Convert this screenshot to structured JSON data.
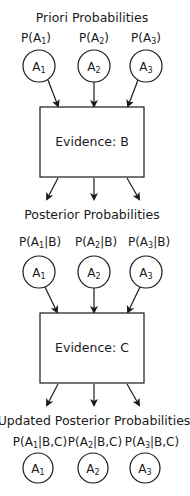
{
  "sections": {
    "priori": {
      "title": "Priori Probabilities",
      "labels": [
        {
          "pre": "P(A",
          "sub": "1",
          "post": ")"
        },
        {
          "pre": "P(A",
          "sub": "2",
          "post": ")"
        },
        {
          "pre": "P(A",
          "sub": "3",
          "post": ")"
        }
      ]
    },
    "posterior": {
      "title": "Posterior Probabilities",
      "labels": [
        {
          "pre": "P(A",
          "sub": "1",
          "post": "|B)"
        },
        {
          "pre": "P(A",
          "sub": "2",
          "post": "|B)"
        },
        {
          "pre": "P(A",
          "sub": "3",
          "post": "|B)"
        }
      ]
    },
    "updated": {
      "title": "Updated Posterior Probabilities",
      "labels": [
        {
          "pre": "P(A",
          "sub": "1",
          "post": "|B,C)"
        },
        {
          "pre": "P(A",
          "sub": "2",
          "post": "|B,C)"
        },
        {
          "pre": "P(A",
          "sub": "3",
          "post": "|B,C)"
        }
      ]
    }
  },
  "nodes": [
    {
      "base": "A",
      "sub": "1"
    },
    {
      "base": "A",
      "sub": "2"
    },
    {
      "base": "A",
      "sub": "3"
    }
  ],
  "evidence": {
    "b": "Evidence: B",
    "c": "Evidence: C"
  },
  "colors": {
    "stroke": "#1a1a1a",
    "background": "#ffffff"
  }
}
